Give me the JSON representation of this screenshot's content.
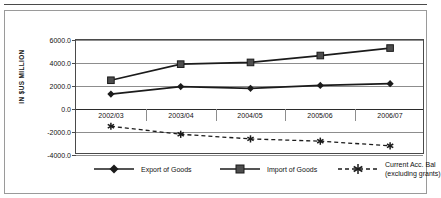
{
  "chart_data": {
    "type": "line",
    "title": "",
    "xlabel": "",
    "ylabel": "IN $US MILLION",
    "categories": [
      "2002/03",
      "2003/04",
      "2004/05",
      "2005/06",
      "2006/07"
    ],
    "ylim": [
      -4000,
      6000
    ],
    "yticks": [
      "6000.0",
      "4000.0",
      "2000.0",
      "0.0",
      "-2000.0",
      "-4000.0"
    ],
    "ytick_values": [
      6000,
      4000,
      2000,
      0,
      -2000,
      -4000
    ],
    "grid": true,
    "legend_position": "bottom",
    "series": [
      {
        "name": "Export of Goods",
        "marker": "diamond",
        "line_style": "solid",
        "values": [
          1300,
          1950,
          1800,
          2050,
          2200
        ]
      },
      {
        "name": "Import of Goods",
        "marker": "square",
        "line_style": "solid",
        "values": [
          2500,
          3900,
          4050,
          4650,
          5300
        ]
      },
      {
        "name": "Current Acc. Bal (excluding grants)",
        "name_line1": "Current Acc. Bal",
        "name_line2": "(excluding grants)",
        "marker": "asterisk",
        "line_style": "dashed",
        "values": [
          -1500,
          -2200,
          -2600,
          -2800,
          -3200
        ]
      }
    ]
  },
  "colors": {
    "line": "#1b1b1b",
    "grid": "#8d8d8d",
    "axis": "#4a4a4a",
    "background": "#ffffff"
  },
  "legend": {
    "items": [
      {
        "label": "Export of Goods",
        "icon": "diamond-marker-icon"
      },
      {
        "label": "Import of Goods",
        "icon": "square-marker-icon"
      },
      {
        "label_line1": "Current Acc. Bal",
        "label_line2": "(excluding grants)",
        "icon": "asterisk-marker-icon"
      }
    ]
  }
}
